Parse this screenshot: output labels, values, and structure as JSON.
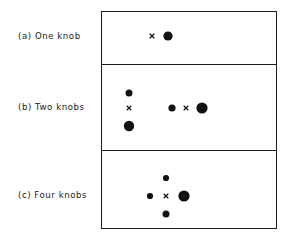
{
  "figure": {
    "background_color": "#ffffff",
    "ink_color": "#1a1a1a",
    "frame": {
      "x": 101,
      "y": 11,
      "width": 176,
      "height": 218,
      "stroke_width": 1.2,
      "dividers_y": [
        64,
        150
      ]
    },
    "labels": {
      "a": "(a)  One knob",
      "b": "(b)  Two knobs",
      "c": "(c)  Four knobs"
    },
    "panels": [
      {
        "id": "panel-a",
        "label_key": "a",
        "label": "(a)  One knob",
        "knob_count": 1,
        "bounds": {
          "x": 101,
          "y": 11,
          "width": 176,
          "height": 53
        },
        "marks": [
          {
            "name": "x-marker",
            "type": "x",
            "cx": 152,
            "cy": 36,
            "size": 4.6
          },
          {
            "name": "knob-dot",
            "type": "dot",
            "cx": 168,
            "cy": 36,
            "r": 4.6
          }
        ]
      },
      {
        "id": "panel-b",
        "label_key": "b",
        "label": "(b)  Two knobs",
        "knob_count": 2,
        "bounds": {
          "x": 101,
          "y": 64,
          "width": 176,
          "height": 86
        },
        "marks": [
          {
            "name": "knob-dot",
            "type": "dot",
            "cx": 129,
            "cy": 93,
            "r": 3.5
          },
          {
            "name": "x-marker",
            "type": "x",
            "cx": 129,
            "cy": 108,
            "size": 4.6
          },
          {
            "name": "knob-dot",
            "type": "dot",
            "cx": 129,
            "cy": 126,
            "r": 5.2
          },
          {
            "name": "knob-dot",
            "type": "dot",
            "cx": 172,
            "cy": 108,
            "r": 3.6
          },
          {
            "name": "x-marker",
            "type": "x",
            "cx": 186,
            "cy": 108,
            "size": 4.6
          },
          {
            "name": "knob-dot",
            "type": "dot",
            "cx": 202,
            "cy": 108,
            "r": 5.6
          }
        ]
      },
      {
        "id": "panel-c",
        "label_key": "c",
        "label": "(c)  Four knobs",
        "knob_count": 4,
        "bounds": {
          "x": 101,
          "y": 150,
          "width": 176,
          "height": 79
        },
        "marks": [
          {
            "name": "knob-dot",
            "type": "dot",
            "cx": 166,
            "cy": 178,
            "r": 3.1
          },
          {
            "name": "knob-dot",
            "type": "dot",
            "cx": 150,
            "cy": 196,
            "r": 3.1
          },
          {
            "name": "x-marker",
            "type": "x",
            "cx": 166,
            "cy": 196,
            "size": 4.6
          },
          {
            "name": "knob-dot",
            "type": "dot",
            "cx": 184,
            "cy": 196,
            "r": 5.6
          },
          {
            "name": "knob-dot",
            "type": "dot",
            "cx": 166,
            "cy": 214,
            "r": 3.5
          }
        ]
      }
    ]
  },
  "chart_data": {
    "type": "scatter",
    "title": "",
    "xlabel": "",
    "ylabel": "",
    "grid": false,
    "legend": null,
    "series": [
      {
        "name": "(a)  One knob",
        "marker_counts": {
          "x": 1,
          "dot": 1
        },
        "points": [
          {
            "symbol": "X",
            "x": 152,
            "y": 36
          },
          {
            "symbol": "dot",
            "x": 168,
            "y": 36,
            "size": 9.2
          }
        ]
      },
      {
        "name": "(b)  Two knobs",
        "marker_counts": {
          "x": 2,
          "dot": 4
        },
        "points": [
          {
            "symbol": "dot",
            "x": 129,
            "y": 93,
            "size": 7.0
          },
          {
            "symbol": "X",
            "x": 129,
            "y": 108
          },
          {
            "symbol": "dot",
            "x": 129,
            "y": 126,
            "size": 10.4
          },
          {
            "symbol": "dot",
            "x": 172,
            "y": 108,
            "size": 7.2
          },
          {
            "symbol": "X",
            "x": 186,
            "y": 108
          },
          {
            "symbol": "dot",
            "x": 202,
            "y": 108,
            "size": 11.2
          }
        ]
      },
      {
        "name": "(c)  Four knobs",
        "marker_counts": {
          "x": 1,
          "dot": 4
        },
        "points": [
          {
            "symbol": "dot",
            "x": 166,
            "y": 178,
            "size": 6.2
          },
          {
            "symbol": "dot",
            "x": 150,
            "y": 196,
            "size": 6.2
          },
          {
            "symbol": "X",
            "x": 166,
            "y": 196
          },
          {
            "symbol": "dot",
            "x": 184,
            "y": 196,
            "size": 11.2
          },
          {
            "symbol": "dot",
            "x": 166,
            "y": 214,
            "size": 7.0
          }
        ]
      }
    ]
  }
}
